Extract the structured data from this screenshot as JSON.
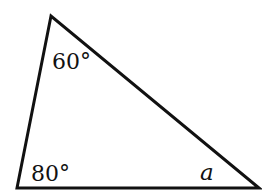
{
  "diagram": {
    "type": "triangle",
    "stroke_color": "#111111",
    "background": "#ffffff",
    "vertices": {
      "top": [
        51,
        16
      ],
      "bottom_left": [
        17,
        188
      ],
      "bottom_right": [
        259,
        188
      ]
    },
    "angles": {
      "top": {
        "label": "60°",
        "value": 60
      },
      "bottom_left": {
        "label": "80°",
        "value": 80
      },
      "bottom_right": {
        "label": "a",
        "value": null
      }
    }
  }
}
